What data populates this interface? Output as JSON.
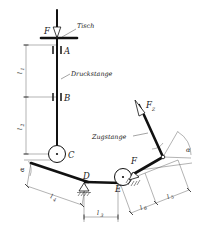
{
  "figure": {
    "domain_note": "technical engineering schematic"
  },
  "colors": {
    "ink": "#111111",
    "thin_line": "#1a1a1a",
    "dimension_line": "#555555",
    "background": "#ffffff"
  },
  "forces": {
    "applied": {
      "label": "F",
      "direction": "down",
      "at": "table"
    },
    "tie": {
      "label": "F",
      "subscript": "Z",
      "direction": "up-left",
      "at": "tie-rod-top"
    }
  },
  "component_labels": {
    "table": "Tisch",
    "push_rod": "Druckstange",
    "tie_rod": "Zugstange"
  },
  "points": {
    "a": "A",
    "b": "B",
    "c": "C",
    "d": "D",
    "e": "E",
    "f": "F"
  },
  "dimensions": [
    {
      "name": "l1",
      "label": "l",
      "subscript": "1",
      "orientation": "vertical",
      "span": "table-to-B"
    },
    {
      "name": "l2",
      "label": "l",
      "subscript": "2",
      "orientation": "vertical",
      "span": "B-to-C"
    },
    {
      "name": "l3",
      "label": "l",
      "subscript": "3",
      "orientation": "horizontal",
      "span": "D-to-E"
    },
    {
      "name": "l4",
      "label": "l",
      "subscript": "4",
      "orientation": "diagonal",
      "span": "C-to-D"
    },
    {
      "name": "l5",
      "label": "l",
      "subscript": "5",
      "orientation": "diagonal",
      "span": "E-to-tie-top"
    },
    {
      "name": "l6",
      "label": "l",
      "subscript": "6",
      "orientation": "diagonal",
      "span": "E-to-F"
    }
  ],
  "angles": [
    {
      "name": "alpha-left",
      "label": "α",
      "at": "C"
    },
    {
      "name": "alpha-right",
      "label": "α",
      "at": "tie-rod-top"
    }
  ],
  "supports": [
    {
      "name": "support-d",
      "type": "pinned-hatched",
      "at": "D"
    },
    {
      "name": "support-e",
      "type": "pinned-hatched",
      "at": "E"
    }
  ]
}
